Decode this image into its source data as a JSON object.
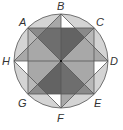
{
  "diagram": {
    "type": "geometry",
    "colors": {
      "outline": "#555555",
      "dark": "#6e6e6e",
      "medium": "#a8a8a8",
      "light": "#d4d4d4",
      "white": "#ffffff"
    },
    "points": {
      "A": "A",
      "B": "B",
      "C": "C",
      "D": "D",
      "E": "E",
      "F": "F",
      "G": "G",
      "H": "H"
    }
  }
}
